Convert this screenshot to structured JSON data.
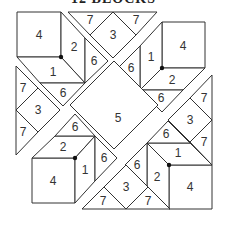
{
  "title": "12 BLOCKS",
  "colors": {
    "stroke": "#333333",
    "fill": "#ffffff",
    "dot": "#111111"
  },
  "pieces": [
    {
      "id": "tl-square",
      "label": "4",
      "points": "17,12 61,12 61,57 17,57",
      "lx": 39,
      "ly": 35
    },
    {
      "id": "tl-face-2",
      "label": "2",
      "points": "61,57 61,12 85,38 85,83",
      "lx": 74,
      "ly": 47
    },
    {
      "id": "tl-face-1",
      "label": "1",
      "points": "61,57 85,83 40,83 17,57",
      "lx": 53,
      "ly": 72
    },
    {
      "id": "tl-tri-6a",
      "label": "6",
      "points": "85,38 108,61 85,83",
      "lx": 94,
      "ly": 61
    },
    {
      "id": "tl-tri-6b",
      "label": "6",
      "points": "40,83 85,83 63,106",
      "lx": 63,
      "ly": 93
    },
    {
      "id": "top-tri-7a",
      "label": "7",
      "points": "68,12 113,12 90,35",
      "lx": 90,
      "ly": 20
    },
    {
      "id": "top-diamond-3",
      "label": "3",
      "points": "90,35 113,12 136,35 113,58",
      "lx": 113,
      "ly": 35
    },
    {
      "id": "top-tri-7b",
      "label": "7",
      "points": "113,12 157,12 136,35",
      "lx": 136,
      "ly": 20
    },
    {
      "id": "left-tri-7a",
      "label": "7",
      "points": "16,66 38,88 16,110",
      "lx": 23,
      "ly": 88
    },
    {
      "id": "left-diamond-3",
      "label": "3",
      "points": "16,110 38,88 60,110 38,132",
      "lx": 38,
      "ly": 110
    },
    {
      "id": "left-tri-7b",
      "label": "7",
      "points": "16,110 38,132 16,155",
      "lx": 23,
      "ly": 132
    },
    {
      "id": "tr-square",
      "label": "4",
      "points": "162,22 205,22 205,68 162,68",
      "lx": 183,
      "ly": 46
    },
    {
      "id": "tr-face-1",
      "label": "1",
      "points": "162,22 162,68 140,90 140,46",
      "lx": 151,
      "ly": 57
    },
    {
      "id": "tr-face-2",
      "label": "2",
      "points": "162,68 205,68 183,90 140,90",
      "lx": 172,
      "ly": 80
    },
    {
      "id": "tr-tri-6a",
      "label": "6",
      "points": "140,46 140,90 118,68",
      "lx": 131,
      "ly": 68
    },
    {
      "id": "tr-tri-6b",
      "label": "6",
      "points": "140,90 183,90 162,112",
      "lx": 161,
      "ly": 98
    },
    {
      "id": "right-tri-7a",
      "label": "7",
      "points": "212,75 212,120 190,98",
      "lx": 204,
      "ly": 98
    },
    {
      "id": "right-diamond-3",
      "label": "3",
      "points": "190,98 212,120 190,142 168,120",
      "lx": 190,
      "ly": 120
    },
    {
      "id": "right-tri-7b",
      "label": "7",
      "points": "212,120 212,165 190,142",
      "lx": 204,
      "ly": 142
    },
    {
      "id": "center-diamond-5",
      "label": "5",
      "points": "114,61 158,105 114,149 70,105",
      "lx": 118,
      "ly": 118
    },
    {
      "id": "bl-square",
      "label": "4",
      "points": "32,158 75,158 75,203 32,203",
      "lx": 53,
      "ly": 181
    },
    {
      "id": "bl-face-2",
      "label": "2",
      "points": "32,158 55,136 95,136 75,158",
      "lx": 63,
      "ly": 147
    },
    {
      "id": "bl-face-1",
      "label": "1",
      "points": "75,158 95,136 95,181 75,203",
      "lx": 85,
      "ly": 170
    },
    {
      "id": "bl-tri-6a",
      "label": "6",
      "points": "55,136 95,136 75,114",
      "lx": 75,
      "ly": 127
    },
    {
      "id": "bl-tri-6b",
      "label": "6",
      "points": "95,136 117,158 95,181",
      "lx": 104,
      "ly": 158
    },
    {
      "id": "br-square",
      "label": "4",
      "points": "169,165 212,165 212,209 169,209",
      "lx": 190,
      "ly": 187
    },
    {
      "id": "br-face-1",
      "label": "1",
      "points": "147,143 190,143 212,165 169,165",
      "lx": 178,
      "ly": 153
    },
    {
      "id": "br-face-2",
      "label": "2",
      "points": "147,143 169,165 169,209 147,187",
      "lx": 157,
      "ly": 177
    },
    {
      "id": "br-tri-6a",
      "label": "6",
      "points": "147,143 190,143 168,121",
      "lx": 166,
      "ly": 134
    },
    {
      "id": "br-tri-6b",
      "label": "6",
      "points": "147,143 147,187 125,165",
      "lx": 137,
      "ly": 165
    },
    {
      "id": "bottom-tri-7a",
      "label": "7",
      "points": "82,209 104,187 126,209",
      "lx": 103,
      "ly": 201
    },
    {
      "id": "bottom-diamond-3",
      "label": "3",
      "points": "104,187 126,165 148,187 126,209",
      "lx": 126,
      "ly": 187
    },
    {
      "id": "bottom-tri-7b",
      "label": "7",
      "points": "126,209 148,187 170,209",
      "lx": 148,
      "ly": 201
    }
  ],
  "dots": [
    {
      "id": "tl-dot",
      "cx": 61,
      "cy": 57
    },
    {
      "id": "tr-dot",
      "cx": 162,
      "cy": 68
    },
    {
      "id": "bl-dot",
      "cx": 75,
      "cy": 158
    },
    {
      "id": "br-dot",
      "cx": 169,
      "cy": 165
    }
  ]
}
